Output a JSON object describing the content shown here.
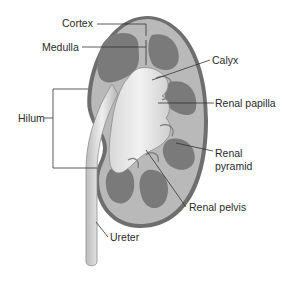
{
  "diagram": {
    "labels": {
      "cortex": "Cortex",
      "medulla": "Medulla",
      "calyx": "Calyx",
      "renal_papilla": "Renal papilla",
      "hilum": "Hilum",
      "renal_pyramid_line1": "Renal",
      "renal_pyramid_line2": "pyramid",
      "renal_pelvis": "Renal pelvis",
      "ureter": "Ureter"
    },
    "colors": {
      "capsule": "#6e6e6e",
      "cortex": "#b9b9b9",
      "pyramid": "#7a7a7a",
      "pelvis": "#e6e6e6",
      "leader_line": "#333333",
      "text": "#2a2a2a"
    }
  }
}
